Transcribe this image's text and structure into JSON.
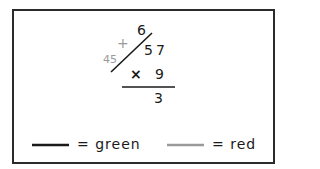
{
  "diagram": {
    "carry_digit": "6",
    "crossed_digit_tens": "5",
    "digit_ones": "7",
    "multiplier": "9",
    "operator": "×",
    "partial_product_digit": "3",
    "annotation_plus": "+",
    "annotation_value": "45"
  },
  "legend": {
    "items": [
      {
        "swatch": "black-line",
        "color": "#1a1a1a",
        "label": "= green"
      },
      {
        "swatch": "gray-line",
        "color": "#9a9a9a",
        "label": "= red"
      }
    ]
  },
  "colors": {
    "ink": "#1a1a1a",
    "annotation_gray": "#9a9a9a",
    "frame": "#2b2b2b"
  }
}
